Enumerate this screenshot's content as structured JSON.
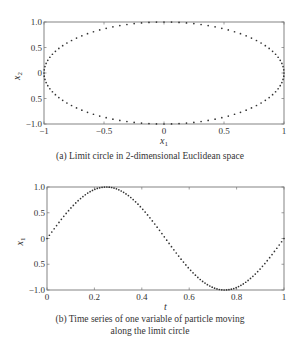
{
  "chart_data": [
    {
      "type": "scatter",
      "id": "a",
      "caption": "(a) Limit circle in 2-dimensional Euclidean space",
      "xlabel": "x",
      "xlabel_sub": "1",
      "ylabel": "x",
      "ylabel_sub": "2",
      "xlim": [
        -1,
        1
      ],
      "ylim": [
        -1,
        1
      ],
      "xticks": [
        -1,
        -0.5,
        0,
        0.5,
        1
      ],
      "xtick_labels": [
        "−1",
        "−0.5",
        "0",
        "0.5",
        "1"
      ],
      "yticks": [
        1.0,
        0.5,
        0,
        -0.5,
        -1.0
      ],
      "ytick_labels": [
        "1.0",
        "0.5",
        "0",
        "0.5",
        "−1.0"
      ],
      "grid": false,
      "series": [
        {
          "name": "limit-circle",
          "marker": "dot",
          "n_points": 100,
          "equation": "x1 = cos(2*pi*t), x2 = sin(2*pi*t), t in [0,1)"
        }
      ],
      "frame_px": {
        "left": 44,
        "top": 22,
        "right": 284,
        "bottom": 124
      }
    },
    {
      "type": "scatter",
      "id": "b",
      "caption_lines": [
        "(b) Time series of one variable of particle moving",
        "along the limit circle"
      ],
      "xlabel": "t",
      "ylabel": "x",
      "ylabel_sub": "1",
      "xlim": [
        0,
        1
      ],
      "ylim": [
        -1,
        1
      ],
      "xticks": [
        0,
        0.2,
        0.4,
        0.6,
        0.8,
        1
      ],
      "xtick_labels": [
        "0",
        "0.2",
        "0.4",
        "0.6",
        "0.8",
        "1"
      ],
      "yticks": [
        1.0,
        0.5,
        0,
        -0.5,
        -1.0
      ],
      "ytick_labels": [
        "1.0",
        "0.5",
        "0",
        "0.5",
        "−1.0"
      ],
      "grid": false,
      "series": [
        {
          "name": "x1(t)",
          "marker": "dot",
          "n_points": 100,
          "equation": "x1 = sin(2*pi*t)",
          "key_points": [
            [
              0,
              0
            ],
            [
              0.25,
              1.0
            ],
            [
              0.5,
              0
            ],
            [
              0.75,
              -1.0
            ],
            [
              1.0,
              0
            ]
          ]
        }
      ],
      "frame_px": {
        "left": 47,
        "top": 187,
        "right": 284,
        "bottom": 290
      }
    }
  ],
  "captions": {
    "a": "(a) Limit circle in 2-dimensional Euclidean space",
    "b_line1": "(b) Time series of one variable of particle moving",
    "b_line2": "along the limit circle"
  },
  "colors": {
    "axis": "#777777",
    "dots": "#333333",
    "text": "#333333"
  }
}
